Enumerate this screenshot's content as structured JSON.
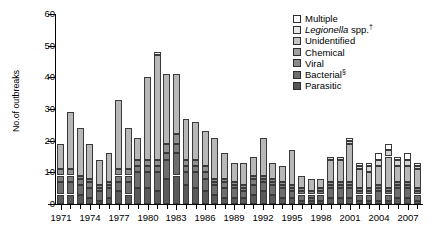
{
  "chart_data": {
    "type": "bar",
    "subtype": "stacked",
    "title": "",
    "xlabel": "",
    "ylabel": "No.of outbreaks",
    "ylim": [
      0,
      60
    ],
    "ytick_labels": [
      "0",
      "10",
      "20",
      "30",
      "40",
      "50",
      "60"
    ],
    "ytick_values": [
      0,
      10,
      20,
      30,
      40,
      50,
      60
    ],
    "grid": false,
    "legend_position": "top-right",
    "xtick_labels": [
      "1971",
      "1974",
      "1977",
      "1980",
      "1983",
      "1986",
      "1989",
      "1992",
      "1995",
      "1998",
      "2001",
      "2004",
      "2007"
    ],
    "xtick_values": [
      1971,
      1974,
      1977,
      1980,
      1983,
      1986,
      1989,
      1992,
      1995,
      1998,
      2001,
      2004,
      2007
    ],
    "categories": [
      1971,
      1972,
      1973,
      1974,
      1975,
      1976,
      1977,
      1978,
      1979,
      1980,
      1981,
      1982,
      1983,
      1984,
      1985,
      1986,
      1987,
      1988,
      1989,
      1990,
      1991,
      1992,
      1993,
      1994,
      1995,
      1996,
      1997,
      1998,
      1999,
      2000,
      2001,
      2002,
      2003,
      2004,
      2005,
      2006,
      2007,
      2008
    ],
    "series": [
      {
        "name": "Parasitic",
        "color": "#5a5a5a",
        "values": [
          3,
          3,
          3,
          2,
          1,
          2,
          4,
          3,
          5,
          5,
          4,
          8,
          9,
          6,
          5,
          4,
          3,
          2,
          2,
          2,
          3,
          4,
          3,
          2,
          2,
          1,
          1,
          1,
          2,
          2,
          2,
          1,
          1,
          1,
          1,
          2,
          2,
          1
        ]
      },
      {
        "name": "Bacterial",
        "color": "#6e6e6e",
        "values": [
          4,
          4,
          3,
          3,
          3,
          3,
          3,
          4,
          5,
          5,
          6,
          6,
          7,
          4,
          5,
          4,
          3,
          3,
          3,
          2,
          3,
          3,
          3,
          3,
          2,
          2,
          1,
          2,
          3,
          3,
          3,
          2,
          2,
          3,
          2,
          3,
          3,
          2
        ]
      },
      {
        "name": "Viral",
        "color": "#7d7d7d",
        "values": [
          2,
          2,
          2,
          2,
          1,
          1,
          2,
          2,
          2,
          2,
          2,
          2,
          3,
          2,
          2,
          2,
          1,
          2,
          1,
          1,
          2,
          1,
          1,
          1,
          1,
          1,
          1,
          1,
          1,
          1,
          1,
          1,
          1,
          1,
          1,
          1,
          1,
          1
        ]
      },
      {
        "name": "Chemical",
        "color": "#909090",
        "values": [
          2,
          2,
          1,
          1,
          1,
          1,
          2,
          2,
          2,
          2,
          2,
          3,
          3,
          2,
          2,
          2,
          1,
          1,
          1,
          1,
          1,
          1,
          1,
          1,
          1,
          1,
          1,
          1,
          1,
          1,
          1,
          1,
          1,
          1,
          1,
          1,
          1,
          1
        ]
      },
      {
        "name": "Unidentified",
        "color": "#b8b8b8",
        "values": [
          8,
          18,
          15,
          11,
          8,
          9,
          22,
          13,
          7,
          26,
          33,
          22,
          19,
          13,
          12,
          11,
          13,
          8,
          6,
          7,
          6,
          12,
          5,
          5,
          11,
          4,
          4,
          3,
          7,
          7,
          12,
          6,
          5,
          6,
          10,
          5,
          5,
          6
        ]
      },
      {
        "name": "Legionella spp.",
        "color": "#d4d4d4",
        "values": [
          0,
          0,
          0,
          0,
          0,
          0,
          0,
          0,
          0,
          0,
          0,
          0,
          0,
          0,
          0,
          0,
          0,
          0,
          0,
          0,
          0,
          0,
          0,
          0,
          0,
          0,
          0,
          0,
          1,
          1,
          1,
          1,
          2,
          2,
          2,
          2,
          2,
          1
        ]
      },
      {
        "name": "Multiple",
        "color": "#ffffff",
        "values": [
          0,
          0,
          0,
          0,
          0,
          0,
          0,
          0,
          0,
          0,
          1,
          0,
          0,
          0,
          0,
          0,
          0,
          0,
          0,
          0,
          0,
          0,
          0,
          0,
          0,
          0,
          0,
          0,
          0,
          0,
          1,
          1,
          1,
          2,
          2,
          1,
          2,
          1
        ]
      }
    ]
  },
  "legend": {
    "items": [
      {
        "label": "Multiple",
        "italic_part": "",
        "sup": "",
        "color": "#ffffff"
      },
      {
        "label": " spp.",
        "italic_part": "Legionella",
        "sup": "†",
        "color": "#e8e8e8"
      },
      {
        "label": "Unidentified",
        "italic_part": "",
        "sup": "",
        "color": "#c4c4c4"
      },
      {
        "label": "Chemical",
        "italic_part": "",
        "sup": "",
        "color": "#a0a0a0"
      },
      {
        "label": "Viral",
        "italic_part": "",
        "sup": "",
        "color": "#8a8a8a"
      },
      {
        "label": "Bacterial",
        "italic_part": "",
        "sup": "§",
        "color": "#6e6e6e"
      },
      {
        "label": "Parasitic",
        "italic_part": "",
        "sup": "",
        "color": "#555555"
      }
    ]
  }
}
